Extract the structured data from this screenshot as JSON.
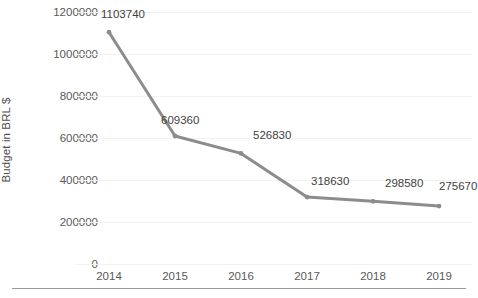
{
  "chart_data": {
    "type": "line",
    "title": "",
    "subtitle": "",
    "xlabel": "",
    "ylabel": "Budget in BRL $",
    "categories": [
      "2014",
      "2015",
      "2016",
      "2017",
      "2018",
      "2019"
    ],
    "values": [
      1103740,
      609360,
      526830,
      318630,
      298580,
      275670
    ],
    "data_labels": [
      "1103740",
      "609360",
      "526830",
      "318630",
      "298580",
      "275670"
    ],
    "series": [
      {
        "name": "Budget",
        "values": [
          1103740,
          609360,
          526830,
          318630,
          298580,
          275670
        ],
        "color": "#8c8c8c"
      }
    ],
    "ylim": [
      0,
      1200000
    ],
    "y_ticks": [
      0,
      200000,
      400000,
      600000,
      800000,
      1000000,
      1200000
    ],
    "y_tick_labels": [
      "0",
      "200000",
      "400000",
      "600000",
      "800000",
      "1000000",
      "1200000"
    ],
    "grid": "horizontal-faint",
    "legend": "none",
    "marker": "circle",
    "line_color": "#8c8c8c",
    "text_color": "#595959"
  }
}
